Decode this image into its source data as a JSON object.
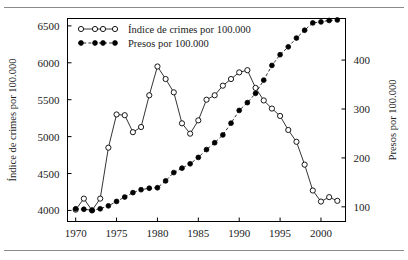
{
  "figure": {
    "background": "#ffffff",
    "frame_color": "#000000",
    "has_top_rule": true,
    "has_bottom_rule": true
  },
  "legend": {
    "position": "top-left-inside",
    "entries": [
      {
        "label": "Índice de crimes por 100.000",
        "marker": "open-circle",
        "line": "solid",
        "color": "#000000"
      },
      {
        "label": "Presos por 100.000",
        "marker": "filled-circle",
        "line": "dashed",
        "color": "#000000"
      }
    ]
  },
  "axes": {
    "x": {
      "label": "",
      "ticks": [
        "1970",
        "1975",
        "1980",
        "1985",
        "1990",
        "1995",
        "2000"
      ],
      "tick_values": [
        1970,
        1975,
        1980,
        1985,
        1990,
        1995,
        2000
      ],
      "range": [
        1969,
        2003
      ]
    },
    "y_left": {
      "label": "Índice de crimes por 100.000",
      "ticks": [
        "4000",
        "4500",
        "5000",
        "5500",
        "6000",
        "6500"
      ],
      "tick_values": [
        4000,
        4500,
        5000,
        5500,
        6000,
        6500
      ],
      "range": [
        3850,
        6600
      ]
    },
    "y_right": {
      "label": "Presos por 100.000",
      "ticks": [
        "100",
        "200",
        "300",
        "400"
      ],
      "tick_values": [
        100,
        200,
        300,
        400
      ],
      "range": [
        70,
        485
      ]
    }
  },
  "chart_data": {
    "type": "line",
    "title": "",
    "xlabel": "",
    "ylabel": "Índice de crimes por 100.000",
    "ylabel_right": "Presos por 100.000",
    "xlim": [
      1969,
      2003
    ],
    "ylim": [
      3850,
      6600
    ],
    "ylim_right": [
      70,
      485
    ],
    "grid": false,
    "legend_position": "upper left",
    "x": [
      1970,
      1971,
      1972,
      1973,
      1974,
      1975,
      1976,
      1977,
      1978,
      1979,
      1980,
      1981,
      1982,
      1983,
      1984,
      1985,
      1986,
      1987,
      1988,
      1989,
      1990,
      1991,
      1992,
      1993,
      1994,
      1995,
      1996,
      1997,
      1998,
      1999,
      2000,
      2001,
      2002
    ],
    "series": [
      {
        "name": "Índice de crimes por 100.000",
        "axis": "left",
        "marker": "open-circle",
        "linestyle": "solid",
        "values": [
          4010,
          4160,
          4000,
          4160,
          4850,
          5300,
          5290,
          5060,
          5130,
          5560,
          5950,
          5780,
          5600,
          5180,
          5040,
          5220,
          5500,
          5560,
          5690,
          5780,
          5870,
          5900,
          5660,
          5490,
          5380,
          5280,
          5090,
          4930,
          4620,
          4270,
          4120,
          4180,
          4130
        ]
      },
      {
        "name": "Presos por 100.000",
        "axis": "right",
        "marker": "filled-circle",
        "linestyle": "dashed",
        "values": [
          96,
          95,
          93,
          96,
          102,
          111,
          120,
          129,
          135,
          138,
          139,
          153,
          170,
          179,
          188,
          201,
          217,
          231,
          247,
          271,
          297,
          313,
          332,
          359,
          389,
          411,
          427,
          445,
          461,
          476,
          478,
          481,
          482
        ]
      }
    ]
  }
}
